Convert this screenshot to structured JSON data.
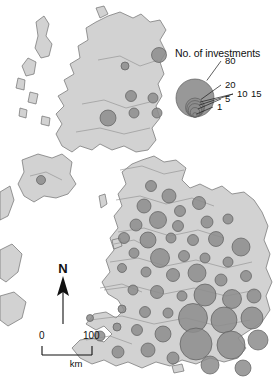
{
  "figure": {
    "kind": "proportional-symbol-map",
    "region": "United Kingdom and Ireland",
    "background_color": "#ffffff",
    "land_color": "#d2d2d2",
    "land_outline_color": "#6f6f6f",
    "bubble_color": "#8d8d8d",
    "bubble_outline_color": "#5d5d5d"
  },
  "legend": {
    "title": "No. of investments",
    "breaks": [
      {
        "label": "80",
        "value": 80
      },
      {
        "label": "20",
        "value": 20
      },
      {
        "label": "15",
        "value": 15
      },
      {
        "label": "10",
        "value": 10
      },
      {
        "label": "5",
        "value": 5
      },
      {
        "label": "1",
        "value": 1
      }
    ]
  },
  "north_arrow": {
    "label": "N"
  },
  "scale_bar": {
    "min_label": "0",
    "max_label": "100",
    "unit": "km"
  },
  "chart_data": {
    "type": "scatter",
    "title": "No. of investments",
    "xlabel": "",
    "ylabel": "",
    "size_legend_values": [
      1,
      5,
      10,
      15,
      20,
      80
    ],
    "size_legend_labels": [
      "1",
      "5",
      "10",
      "15",
      "20",
      "80"
    ],
    "scale_bar_km": 100,
    "points": [
      {
        "x": 125,
        "y": 66,
        "r": 4.0,
        "value": 3
      },
      {
        "x": 159,
        "y": 55,
        "r": 7.5,
        "value": 12
      },
      {
        "x": 131,
        "y": 96,
        "r": 5.5,
        "value": 6
      },
      {
        "x": 153,
        "y": 98,
        "r": 5.0,
        "value": 5
      },
      {
        "x": 108,
        "y": 118,
        "r": 8.0,
        "value": 14
      },
      {
        "x": 134,
        "y": 113,
        "r": 5.0,
        "value": 5
      },
      {
        "x": 157,
        "y": 113,
        "r": 5.0,
        "value": 5
      },
      {
        "x": 41,
        "y": 180,
        "r": 4.5,
        "value": 4
      },
      {
        "x": 151,
        "y": 186,
        "r": 5.5,
        "value": 6
      },
      {
        "x": 169,
        "y": 196,
        "r": 7.0,
        "value": 10
      },
      {
        "x": 144,
        "y": 206,
        "r": 7.0,
        "value": 10
      },
      {
        "x": 180,
        "y": 211,
        "r": 5.5,
        "value": 6
      },
      {
        "x": 199,
        "y": 203,
        "r": 6.5,
        "value": 9
      },
      {
        "x": 158,
        "y": 220,
        "r": 8.5,
        "value": 16
      },
      {
        "x": 136,
        "y": 225,
        "r": 6.0,
        "value": 7
      },
      {
        "x": 178,
        "y": 226,
        "r": 5.5,
        "value": 6
      },
      {
        "x": 207,
        "y": 222,
        "r": 6.0,
        "value": 7
      },
      {
        "x": 228,
        "y": 219,
        "r": 5.0,
        "value": 5
      },
      {
        "x": 124,
        "y": 238,
        "r": 5.5,
        "value": 6
      },
      {
        "x": 148,
        "y": 240,
        "r": 8.0,
        "value": 14
      },
      {
        "x": 171,
        "y": 238,
        "r": 5.0,
        "value": 5
      },
      {
        "x": 193,
        "y": 240,
        "r": 5.5,
        "value": 6
      },
      {
        "x": 216,
        "y": 239,
        "r": 7.5,
        "value": 12
      },
      {
        "x": 241,
        "y": 247,
        "r": 9.0,
        "value": 18
      },
      {
        "x": 134,
        "y": 253,
        "r": 5.0,
        "value": 5
      },
      {
        "x": 160,
        "y": 258,
        "r": 9.5,
        "value": 20
      },
      {
        "x": 184,
        "y": 256,
        "r": 5.5,
        "value": 6
      },
      {
        "x": 205,
        "y": 258,
        "r": 5.0,
        "value": 5
      },
      {
        "x": 228,
        "y": 262,
        "r": 5.0,
        "value": 5
      },
      {
        "x": 122,
        "y": 268,
        "r": 4.5,
        "value": 4
      },
      {
        "x": 146,
        "y": 272,
        "r": 5.0,
        "value": 5
      },
      {
        "x": 173,
        "y": 275,
        "r": 6.5,
        "value": 9
      },
      {
        "x": 197,
        "y": 273,
        "r": 9.0,
        "value": 18
      },
      {
        "x": 221,
        "y": 280,
        "r": 6.0,
        "value": 7
      },
      {
        "x": 246,
        "y": 276,
        "r": 5.5,
        "value": 6
      },
      {
        "x": 133,
        "y": 290,
        "r": 5.0,
        "value": 5
      },
      {
        "x": 157,
        "y": 292,
        "r": 6.5,
        "value": 9
      },
      {
        "x": 182,
        "y": 296,
        "r": 5.0,
        "value": 5
      },
      {
        "x": 205,
        "y": 295,
        "r": 11.0,
        "value": 30
      },
      {
        "x": 232,
        "y": 299,
        "r": 9.5,
        "value": 20
      },
      {
        "x": 254,
        "y": 296,
        "r": 7.0,
        "value": 10
      },
      {
        "x": 122,
        "y": 309,
        "r": 4.0,
        "value": 3
      },
      {
        "x": 145,
        "y": 312,
        "r": 5.5,
        "value": 6
      },
      {
        "x": 168,
        "y": 313,
        "r": 5.0,
        "value": 5
      },
      {
        "x": 193,
        "y": 318,
        "r": 14.5,
        "value": 60
      },
      {
        "x": 224,
        "y": 320,
        "r": 13.0,
        "value": 48
      },
      {
        "x": 252,
        "y": 318,
        "r": 11.0,
        "value": 30
      },
      {
        "x": 117,
        "y": 327,
        "r": 4.0,
        "value": 3
      },
      {
        "x": 137,
        "y": 330,
        "r": 5.5,
        "value": 6
      },
      {
        "x": 163,
        "y": 334,
        "r": 8.0,
        "value": 14
      },
      {
        "x": 196,
        "y": 344,
        "r": 16.0,
        "value": 75
      },
      {
        "x": 231,
        "y": 345,
        "r": 14.0,
        "value": 56
      },
      {
        "x": 258,
        "y": 340,
        "r": 10.0,
        "value": 24
      },
      {
        "x": 148,
        "y": 350,
        "r": 7.0,
        "value": 10
      },
      {
        "x": 173,
        "y": 358,
        "r": 6.0,
        "value": 7
      },
      {
        "x": 210,
        "y": 365,
        "r": 9.0,
        "value": 18
      },
      {
        "x": 243,
        "y": 368,
        "r": 8.0,
        "value": 14
      },
      {
        "x": 100,
        "y": 336,
        "r": 5.0,
        "value": 5
      },
      {
        "x": 118,
        "y": 352,
        "r": 6.0,
        "value": 7
      },
      {
        "x": 90,
        "y": 318,
        "r": 3.5,
        "value": 2
      }
    ]
  }
}
